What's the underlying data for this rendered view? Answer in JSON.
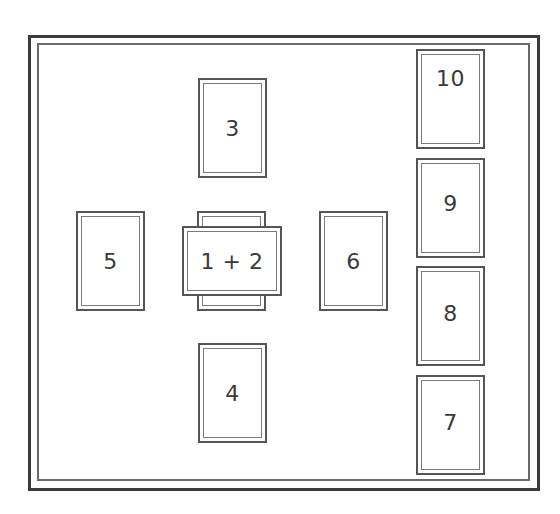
{
  "layout": {
    "title": "",
    "positions": [
      {
        "id": "card-1",
        "label": "1",
        "orientation": "vertical",
        "note": "covered by card 2"
      },
      {
        "id": "card-2",
        "label": "1 + 2",
        "orientation": "horizontal"
      },
      {
        "id": "card-3",
        "label": "3"
      },
      {
        "id": "card-4",
        "label": "4"
      },
      {
        "id": "card-5",
        "label": "5"
      },
      {
        "id": "card-6",
        "label": "6"
      },
      {
        "id": "card-7",
        "label": "7"
      },
      {
        "id": "card-8",
        "label": "8"
      },
      {
        "id": "card-9",
        "label": "9"
      },
      {
        "id": "card-10",
        "label": "10"
      }
    ]
  },
  "labels": {
    "cross": "1 + 2",
    "top": "3",
    "bottom": "4",
    "left": "5",
    "right": "6",
    "staff_1": "7",
    "staff_2": "8",
    "staff_3": "9",
    "staff_4": "10"
  },
  "colors": {
    "outer_frame": "#3a3a3a",
    "inner_frame": "#6a6a6a",
    "card_border": "#555555",
    "text": "#3a3a3a",
    "background": "#ffffff"
  }
}
